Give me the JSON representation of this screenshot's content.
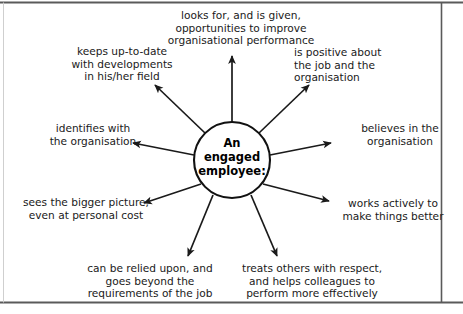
{
  "diagram": {
    "type": "radial-spoke",
    "hub": {
      "lines": [
        "An",
        "engaged",
        "employee:"
      ]
    },
    "nodes": [
      {
        "id": "opportunities",
        "position": "top",
        "align": "center",
        "lines": [
          "looks for, and is given,",
          "opportunities to improve",
          "organisational performance"
        ]
      },
      {
        "id": "up-to-date",
        "position": "upper-left",
        "align": "center",
        "lines": [
          "keeps up-to-date",
          "with developments",
          "in his/her field"
        ]
      },
      {
        "id": "positive",
        "position": "upper-right",
        "align": "left",
        "lines": [
          "is positive about",
          "the job and the",
          "organisation"
        ]
      },
      {
        "id": "identifies",
        "position": "left",
        "align": "center",
        "lines": [
          "identifies with",
          "the organisation"
        ]
      },
      {
        "id": "believes",
        "position": "right",
        "align": "center",
        "lines": [
          "believes in the",
          "organisation"
        ]
      },
      {
        "id": "bigger-picture",
        "position": "lower-left",
        "align": "center",
        "lines": [
          "sees the bigger picture,",
          "even at personal cost"
        ]
      },
      {
        "id": "works-actively",
        "position": "lower-right",
        "align": "center",
        "lines": [
          "works actively to",
          "make things better"
        ]
      },
      {
        "id": "relied-upon",
        "position": "bottom-left",
        "align": "center",
        "lines": [
          "can be relied upon, and",
          "goes beyond the",
          "requirements of the job"
        ]
      },
      {
        "id": "respect",
        "position": "bottom-right",
        "align": "center",
        "lines": [
          "treats others with respect,",
          "and helps colleagues to",
          "perform more effectively"
        ]
      }
    ],
    "colors": {
      "line": "#1a1a1a",
      "text": "#1a1a1a",
      "hub_fill": "#ffffff",
      "frame": "#5a5a5a",
      "background": "#ffffff"
    }
  }
}
